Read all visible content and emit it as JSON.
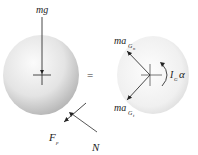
{
  "diagram": {
    "left": {
      "weight_label": "mg",
      "friction_label": "F",
      "friction_sub": "p",
      "normal_label": "N"
    },
    "equals": "=",
    "right": {
      "normal_accel_label": "ma",
      "normal_accel_sub": "G",
      "normal_accel_subsub": "n",
      "tangent_accel_label": "ma",
      "tangent_accel_sub": "G",
      "tangent_accel_subsub": "t",
      "moment_label": "I",
      "moment_sub": "G",
      "moment_alpha": "α"
    },
    "colors": {
      "disc_light": "#fafafa",
      "disc_dark": "#b8b8b8",
      "line": "#333333"
    }
  }
}
